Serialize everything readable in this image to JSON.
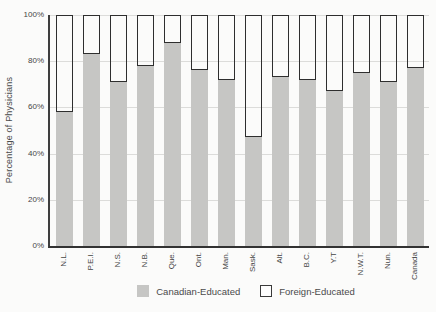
{
  "chart_data": {
    "type": "bar",
    "stacked": true,
    "title": "",
    "xlabel": "",
    "ylabel": "Percentage of Physicians",
    "ylim": [
      0,
      100
    ],
    "ytick_step": 20,
    "yticks": [
      "0%",
      "20%",
      "40%",
      "60%",
      "80%",
      "100%"
    ],
    "grid": true,
    "legend_position": "bottom",
    "categories": [
      "N.L.",
      "P.E.I.",
      "N.S.",
      "N.B.",
      "Que.",
      "Ont.",
      "Man.",
      "Sask.",
      "Alt.",
      "B.C.",
      "Y.T",
      "N.W.T.",
      "Nun.",
      "Canada"
    ],
    "series": [
      {
        "name": "Canadian-Educated",
        "color": "#c6c6c4",
        "values": [
          58,
          83,
          71,
          78,
          88,
          76,
          72,
          47,
          73,
          72,
          67,
          75,
          71,
          77
        ]
      },
      {
        "name": "Foreign-Educated",
        "color": "#ffffff",
        "values": [
          42,
          17,
          29,
          22,
          12,
          24,
          28,
          53,
          27,
          28,
          33,
          25,
          29,
          23
        ]
      }
    ]
  },
  "colors": {
    "bar_fill": "#c6c6c4",
    "bar_outline": "#2e2e2e",
    "gridline": "#dcdcda",
    "axis": "#333333",
    "text": "#454545",
    "background": "#fbfbfa"
  }
}
